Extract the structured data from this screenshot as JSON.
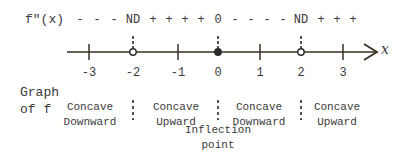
{
  "header": {
    "function_label": "f\"(x)",
    "signs": [
      {
        "text": "-",
        "x": 80
      },
      {
        "text": "-",
        "x": 97
      },
      {
        "text": "-",
        "x": 114
      },
      {
        "text": "ND",
        "x": 133
      },
      {
        "text": "+",
        "x": 153
      },
      {
        "text": "+",
        "x": 169
      },
      {
        "text": "+",
        "x": 185
      },
      {
        "text": "+",
        "x": 201
      },
      {
        "text": "0",
        "x": 218
      },
      {
        "text": "-",
        "x": 235
      },
      {
        "text": "-",
        "x": 251
      },
      {
        "text": "-",
        "x": 267
      },
      {
        "text": "-",
        "x": 283
      },
      {
        "text": "ND",
        "x": 301
      },
      {
        "text": "+",
        "x": 321
      },
      {
        "text": "+",
        "x": 337
      },
      {
        "text": "+",
        "x": 353
      }
    ]
  },
  "axis": {
    "variable": "x",
    "ticks": [
      {
        "label": "-3",
        "x": 89,
        "marker": "tick"
      },
      {
        "label": "-2",
        "x": 133,
        "marker": "open-circle"
      },
      {
        "label": "-1",
        "x": 178,
        "marker": "tick"
      },
      {
        "label": "0",
        "x": 218,
        "marker": "filled-dot"
      },
      {
        "label": "1",
        "x": 260,
        "marker": "tick"
      },
      {
        "label": "2",
        "x": 301,
        "marker": "open-circle"
      },
      {
        "label": "3",
        "x": 343,
        "marker": "tick"
      }
    ]
  },
  "graph": {
    "label_line1": "Graph",
    "label_line2": "of f",
    "regions": [
      {
        "line1": "Concave",
        "line2": "Downward",
        "x": 90
      },
      {
        "line1": "Concave",
        "line2": "Upward",
        "x": 176
      },
      {
        "line1": "Concave",
        "line2": "Downward",
        "x": 259
      },
      {
        "line1": "Concave",
        "line2": "Upward",
        "x": 337
      }
    ],
    "inflection_line1": "Inflection",
    "inflection_line2": "point"
  }
}
